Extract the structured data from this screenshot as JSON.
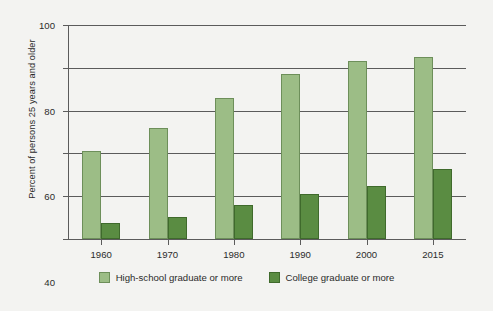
{
  "chart_data": {
    "type": "bar",
    "title": "",
    "xlabel": "",
    "ylabel": "Percent of persons 25 years and older",
    "categories": [
      "1960",
      "1970",
      "1980",
      "1990",
      "2000",
      "2015"
    ],
    "series": [
      {
        "name": "High-school graduate or more",
        "color": "#9cbd86",
        "values": [
          41,
          52,
          66,
          77,
          83,
          85
        ]
      },
      {
        "name": "College graduate or more",
        "color": "#5a8c42",
        "values": [
          7.5,
          10.5,
          16,
          21,
          25,
          32.5
        ]
      }
    ],
    "ylim": [
      0,
      100
    ],
    "yticks": [
      0,
      20,
      40,
      60,
      80,
      100
    ],
    "ytick_labels": [
      "0",
      "20",
      "40",
      "60",
      "80",
      "100"
    ],
    "grid": true,
    "legend_position": "bottom"
  }
}
